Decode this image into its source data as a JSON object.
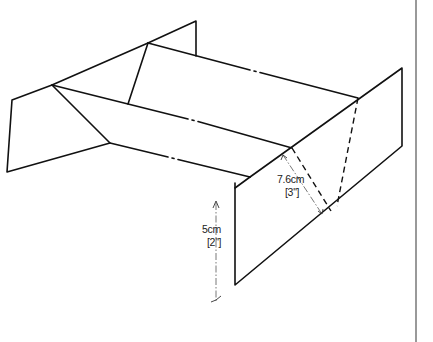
{
  "figure": {
    "colors": {
      "line": "#111111",
      "dimension_line": "#555555",
      "background": "#ffffff"
    }
  },
  "dimensions": {
    "height": {
      "metric": "5cm",
      "imperial": "[2\"]"
    },
    "depth": {
      "metric": "7.6cm",
      "imperial": "[3\"]"
    }
  }
}
